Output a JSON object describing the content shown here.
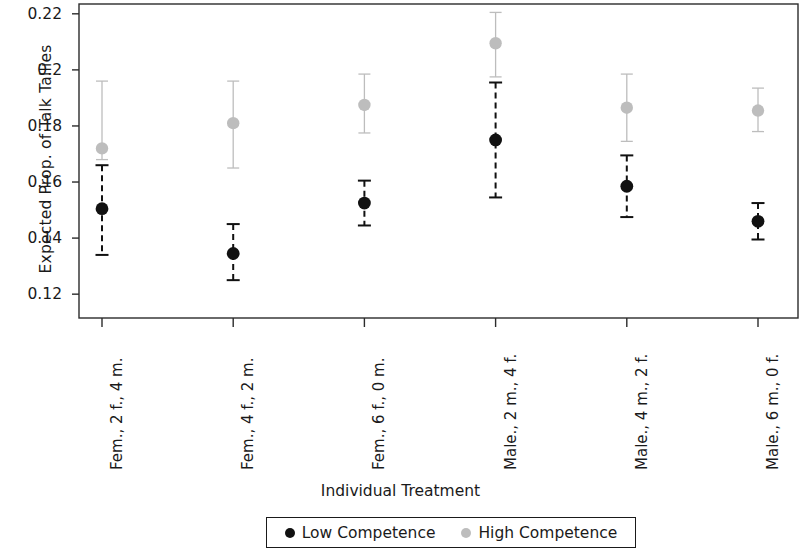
{
  "chart_data": {
    "type": "scatter",
    "title": "",
    "xlabel": "Individual Treatment",
    "ylabel": "Expected Prop. of Talk Tallies",
    "ylim": [
      0.1115,
      0.2235
    ],
    "yticks": [
      0.12,
      0.14,
      0.16,
      0.18,
      0.2,
      0.22
    ],
    "ytick_labels": [
      "0.12",
      "0.14",
      "0.16",
      "0.18",
      "0.2",
      "0.22"
    ],
    "grid": false,
    "legend_position": "bottom",
    "error_bars": "vertical-capped",
    "categories": [
      "Fem., 2 f., 4 m.",
      "Fem., 4 f., 2 m.",
      "Fem., 6 f., 0 m.",
      "Male., 2 m., 4 f.",
      "Male., 4 m., 2 f.",
      "Male., 6 m., 0 f."
    ],
    "series": [
      {
        "name": "Low Competence",
        "color": "#111111",
        "values": [
          0.1505,
          0.1345,
          0.1525,
          0.175,
          0.1585,
          0.146
        ],
        "lower": [
          0.134,
          0.125,
          0.1445,
          0.1545,
          0.1475,
          0.1395
        ],
        "upper": [
          0.166,
          0.145,
          0.1605,
          0.1955,
          0.1695,
          0.1525
        ]
      },
      {
        "name": "High Competence",
        "color": "#bdbdbd",
        "values": [
          0.172,
          0.181,
          0.1875,
          0.2095,
          0.1865,
          0.1855
        ],
        "lower": [
          0.168,
          0.165,
          0.1775,
          0.1975,
          0.1745,
          0.178
        ],
        "upper": [
          0.196,
          0.196,
          0.1985,
          0.2205,
          0.1985,
          0.1935
        ]
      }
    ]
  },
  "legend": {
    "entries": [
      {
        "label": "Low Competence",
        "color": "#111111"
      },
      {
        "label": "High Competence",
        "color": "#bdbdbd"
      }
    ]
  },
  "axes": {
    "frame_color": "#2b2b2b"
  }
}
